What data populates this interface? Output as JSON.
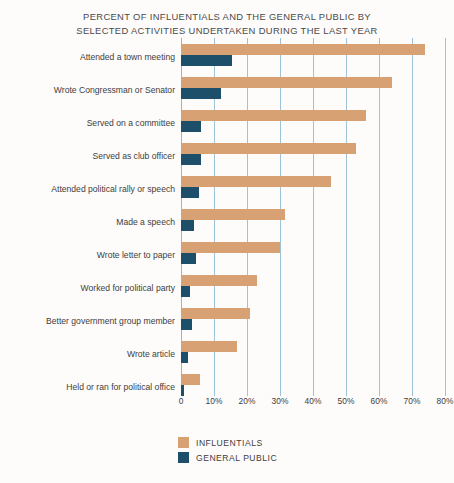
{
  "chart_data": {
    "type": "bar",
    "orientation": "horizontal",
    "title": "PERCENT OF INFLUENTIALS AND THE GENERAL PUBLIC BY\nSELECTED ACTIVITIES UNDERTAKEN DURING THE LAST YEAR",
    "xlabel": "",
    "ylabel": "",
    "xlim": [
      0,
      80
    ],
    "grid": true,
    "legend_position": "bottom-left",
    "categories": [
      "Attended a town meeting",
      "Wrote Congressman or Senator",
      "Served on a committee",
      "Served as club officer",
      "Attended political rally or speech",
      "Made a speech",
      "Wrote letter to paper",
      "Worked for political party",
      "Better government group member",
      "Wrote article",
      "Held or ran for political office"
    ],
    "tick_labels": [
      "0",
      "10%",
      "20%",
      "30%",
      "40%",
      "50%",
      "60%",
      "70%",
      "80%"
    ],
    "tick_values": [
      0,
      10,
      20,
      30,
      40,
      50,
      60,
      70,
      80
    ],
    "series": [
      {
        "name": "INFLUENTIALS",
        "color": "#d7a173",
        "values": [
          74,
          64,
          56,
          53,
          45.5,
          31.5,
          30,
          23,
          21,
          17,
          5.7
        ]
      },
      {
        "name": "GENERAL PUBLIC",
        "color": "#1d4f6a",
        "values": [
          15.5,
          12,
          6,
          6,
          5.5,
          4,
          4.5,
          2.7,
          3.3,
          2,
          1
        ]
      }
    ]
  },
  "colors": {
    "influentials": "#d7a173",
    "general_public": "#1d4f6a",
    "gridline": "#9fc3d6",
    "background": "#fdfcfa",
    "text": "#3d3d3d"
  }
}
